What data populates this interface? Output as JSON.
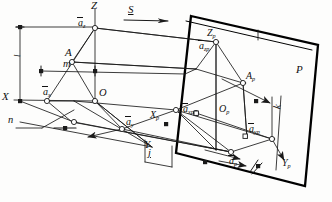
{
  "figure": {
    "kind": "technical-line-diagram",
    "stroke_color": "#1a1a1a",
    "plane_edge_color": "#000000",
    "background": "#fdfdfc"
  },
  "axes": {
    "z_label": "Z",
    "x_label": "X",
    "y_label": "Y",
    "origin_label": "O"
  },
  "plane": {
    "label": "P",
    "z_label": "Z",
    "z_sub": "p",
    "x_label": "X",
    "x_sub": "p",
    "y_label": "Y",
    "y_sub": "p",
    "origin_label": "O",
    "origin_sub": "p"
  },
  "points": {
    "a_label": "A",
    "a_projected_label": "A",
    "a_projected_sub": "p"
  },
  "vectors": {
    "az": {
      "base": "a",
      "sub": "z"
    },
    "ax": {
      "base": "a",
      "sub": "x"
    },
    "ay": {
      "base": "a",
      "sub": "y"
    },
    "azp": {
      "base": "a",
      "sub": "zp"
    },
    "axp": {
      "base": "a",
      "sub": "xp"
    },
    "ayp": {
      "base": "a",
      "sub": "yp"
    },
    "ap": {
      "base": "a",
      "sub": "p"
    }
  },
  "annotations": {
    "s_label": "S",
    "m_label": "m",
    "n_label": "n",
    "j_label": "j",
    "k_label": "k",
    "l_label": "l"
  }
}
